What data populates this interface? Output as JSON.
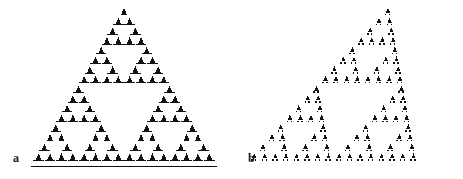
{
  "figure": {
    "background_color": "#ffffff",
    "ink_color": "#121212",
    "width": 463,
    "height": 179
  },
  "panels": [
    {
      "id": "a",
      "label": "a",
      "label_x": 13,
      "label_y": 152,
      "caption": "Sierpinski triangle built from filled triangle glyphs with underlined bases",
      "pattern": "sierpinski-upright",
      "depth": 4,
      "glyph": "triangle-with-baseline",
      "apex_x": 124,
      "apex_y": 8,
      "base_left_x": 33,
      "base_right_x": 215,
      "base_y": 163,
      "unit_width": 11.4,
      "unit_height": 9.7,
      "shear": 0.0
    },
    {
      "id": "b",
      "label": "b",
      "label_x": 248,
      "label_y": 152,
      "caption": "Sheared Sierpinski pattern built from triangle-and-dot glyphs",
      "pattern": "sierpinski-sheared",
      "depth": 4,
      "glyph": "triangle-with-two-dots",
      "apex_x": 388,
      "apex_y": 8,
      "base_left_x": 285,
      "base_right_x": 455,
      "base_y": 163,
      "unit_width": 11.0,
      "unit_height": 9.7,
      "shear": -0.34
    }
  ],
  "chart_data": {
    "type": "scatter",
    "xlabel": "",
    "ylabel": "",
    "grid": false,
    "legend": "none",
    "xlim": [
      0,
      463
    ],
    "ylim": [
      0,
      179
    ],
    "series": [
      {
        "name": "a",
        "description": "Sierpinski triangle, 4 levels of recursion, 81 terminal glyphs, upright",
        "recursion_depth": 4,
        "terminal_glyph_count": 81,
        "branching_factor": 3,
        "shear_factor": 0.0,
        "glyph": "triangle-with-baseline"
      },
      {
        "name": "b",
        "description": "Sheared Sierpinski triangle, 4 levels of recursion, 81 terminal glyphs, leaning left",
        "recursion_depth": 4,
        "terminal_glyph_count": 81,
        "branching_factor": 3,
        "shear_factor": -0.34,
        "glyph": "triangle-with-two-dots"
      }
    ]
  }
}
